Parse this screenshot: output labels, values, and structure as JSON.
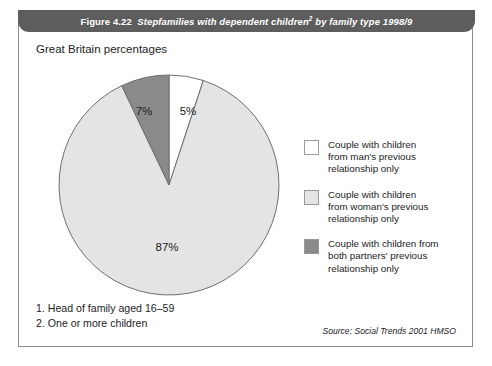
{
  "figure": {
    "number": "Figure 4.22",
    "title": "Stepfamilies with dependent children",
    "title_superscript": "2",
    "title_tail": " by family type 1998/9",
    "subtitle": "Great Britain percentages"
  },
  "chart_data": {
    "type": "pie",
    "subtitle": "Great Britain percentages",
    "unit": "percentages",
    "legend_position": "right",
    "categories": [
      "Couple with children from man's previous relationship only",
      "Couple with children from woman's previous relationship only",
      "Couple with children from both partners' previous relationship only"
    ],
    "values": [
      5,
      87,
      7
    ],
    "labels": [
      "5%",
      "87%",
      "7%"
    ],
    "colors": [
      "#ffffff",
      "#e4e4e4",
      "#8a8a8a"
    ],
    "start_angle_deg": 0,
    "direction": "clockwise"
  },
  "legend": {
    "items": [
      {
        "color": "#ffffff",
        "line1": "Couple with children",
        "line2": "from man's previous",
        "line3": "relationship only"
      },
      {
        "color": "#e4e4e4",
        "line1": "Couple with children",
        "line2": "from woman's previous",
        "line3": "relationship only"
      },
      {
        "color": "#8a8a8a",
        "line1": "Couple with children from",
        "line2": "both partners' previous",
        "line3": "relationship only"
      }
    ]
  },
  "footnotes": {
    "note1": "1. Head of family aged 16–59",
    "note2": "2. One or more children"
  },
  "source": "Source: Social Trends 2001 HMSO"
}
